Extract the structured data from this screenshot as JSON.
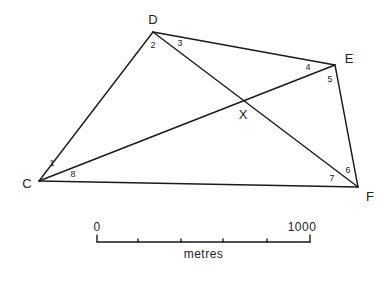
{
  "diagram": {
    "type": "survey-quadrilateral",
    "vertices": [
      {
        "id": "C",
        "label": "C",
        "x": 39,
        "y": 181,
        "lx": 27,
        "ly": 188
      },
      {
        "id": "D",
        "label": "D",
        "x": 153,
        "y": 32,
        "lx": 153,
        "ly": 24
      },
      {
        "id": "E",
        "label": "E",
        "x": 335,
        "y": 65,
        "lx": 349,
        "ly": 63
      },
      {
        "id": "F",
        "label": "F",
        "x": 358,
        "y": 187,
        "lx": 370,
        "ly": 201
      }
    ],
    "intersection": {
      "id": "X",
      "label": "X",
      "x": 243,
      "y": 100,
      "lx": 243,
      "ly": 119
    },
    "edges": [
      [
        "C",
        "D"
      ],
      [
        "D",
        "E"
      ],
      [
        "E",
        "F"
      ],
      [
        "F",
        "C"
      ],
      [
        "C",
        "E"
      ],
      [
        "D",
        "F"
      ]
    ],
    "angles": [
      {
        "label": "1",
        "x": 52,
        "y": 166
      },
      {
        "label": "2",
        "x": 153,
        "y": 48
      },
      {
        "label": "3",
        "x": 180,
        "y": 46
      },
      {
        "label": "4",
        "x": 308,
        "y": 70
      },
      {
        "label": "5",
        "x": 330,
        "y": 82
      },
      {
        "label": "6",
        "x": 348,
        "y": 173
      },
      {
        "label": "7",
        "x": 332,
        "y": 181
      },
      {
        "label": "8",
        "x": 73,
        "y": 177
      }
    ]
  },
  "scale_bar": {
    "start_label": "0",
    "end_label": "1000",
    "unit_label": "metres",
    "x_start": 97,
    "x_end": 310,
    "y": 242,
    "ticks": [
      138,
      181,
      223,
      267
    ]
  }
}
